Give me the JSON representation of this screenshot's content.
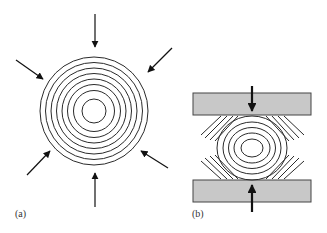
{
  "figure": {
    "panels": [
      {
        "id": "a",
        "label": "(a)",
        "description": "Concentric circles compressed uniformly from all directions",
        "rings": 8,
        "arrows": 6
      },
      {
        "id": "b",
        "label": "(b)",
        "description": "Concentric ellipses compressed between two plates",
        "rings": 5,
        "plates": 2,
        "arrows": 2,
        "diagonal_lines_per_corner": 4
      }
    ]
  },
  "colors": {
    "line": "#2a2a2a",
    "plate_fill": "#c8c8c8",
    "plate_border": "#444444",
    "background": "#ffffff"
  }
}
